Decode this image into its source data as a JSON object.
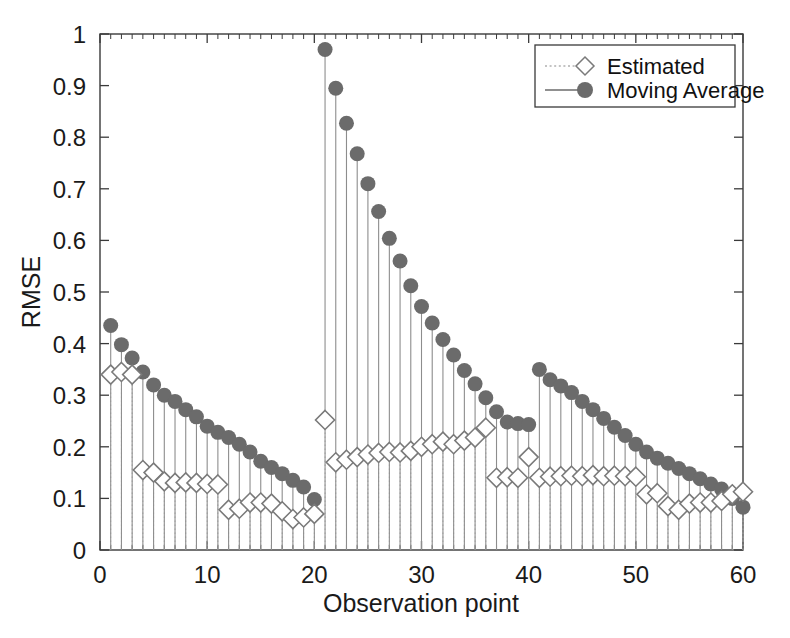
{
  "chart_data": {
    "type": "line",
    "title": "",
    "xlabel": "Observation point",
    "ylabel": "RMSE",
    "xlim": [
      0,
      60
    ],
    "ylim": [
      0,
      1
    ],
    "xticks": [
      0,
      10,
      20,
      30,
      40,
      50,
      60
    ],
    "xticklabels": [
      "0",
      "10",
      "20",
      "30",
      "40",
      "50",
      "60"
    ],
    "yticks": [
      0,
      0.1,
      0.2,
      0.3,
      0.4,
      0.5,
      0.6,
      0.7,
      0.8,
      0.9,
      1
    ],
    "yticklabels": [
      "0",
      "0.1",
      "0.2",
      "0.3",
      "0.4",
      "0.5",
      "0.6",
      "0.7",
      "0.8",
      "0.9",
      "1"
    ],
    "grid": false,
    "minor_xticks": true,
    "legend_position": "top-right",
    "x": [
      1,
      2,
      3,
      4,
      5,
      6,
      7,
      8,
      9,
      10,
      11,
      12,
      13,
      14,
      15,
      16,
      17,
      18,
      19,
      20,
      21,
      22,
      23,
      24,
      25,
      26,
      27,
      28,
      29,
      30,
      31,
      32,
      33,
      34,
      35,
      36,
      37,
      38,
      39,
      40,
      41,
      42,
      43,
      44,
      45,
      46,
      47,
      48,
      49,
      50,
      51,
      52,
      53,
      54,
      55,
      56,
      57,
      58,
      59,
      60
    ],
    "series": [
      {
        "name": "Estimated",
        "marker": "open-diamond",
        "linestyle": "dotted",
        "color": "#7a7a7a",
        "values": [
          0.34,
          0.345,
          0.34,
          0.155,
          0.15,
          0.133,
          0.13,
          0.131,
          0.13,
          0.128,
          0.127,
          0.078,
          0.08,
          0.092,
          0.092,
          0.09,
          0.075,
          0.06,
          0.063,
          0.07,
          0.252,
          0.17,
          0.175,
          0.18,
          0.185,
          0.188,
          0.19,
          0.189,
          0.192,
          0.2,
          0.205,
          0.21,
          0.205,
          0.212,
          0.218,
          0.237,
          0.14,
          0.141,
          0.14,
          0.18,
          0.14,
          0.142,
          0.143,
          0.144,
          0.143,
          0.145,
          0.143,
          0.144,
          0.143,
          0.142,
          0.108,
          0.11,
          0.085,
          0.078,
          0.09,
          0.092,
          0.092,
          0.095,
          0.108,
          0.113
        ]
      },
      {
        "name": "Moving Average",
        "marker": "filled-circle",
        "linestyle": "solid",
        "color": "#6b6b6b",
        "values": [
          0.435,
          0.398,
          0.372,
          0.345,
          0.32,
          0.3,
          0.288,
          0.272,
          0.258,
          0.24,
          0.228,
          0.218,
          0.205,
          0.19,
          0.172,
          0.16,
          0.148,
          0.135,
          0.122,
          0.098,
          0.97,
          0.895,
          0.827,
          0.768,
          0.71,
          0.656,
          0.604,
          0.56,
          0.512,
          0.472,
          0.44,
          0.408,
          0.378,
          0.348,
          0.322,
          0.295,
          0.268,
          0.248,
          0.245,
          0.243,
          0.35,
          0.33,
          0.318,
          0.305,
          0.288,
          0.272,
          0.255,
          0.238,
          0.222,
          0.205,
          0.19,
          0.178,
          0.168,
          0.158,
          0.148,
          0.138,
          0.128,
          0.118,
          0.1,
          0.083
        ]
      }
    ]
  },
  "legend": {
    "entries": [
      {
        "label": "Estimated"
      },
      {
        "label": "Moving Average"
      }
    ]
  },
  "colors": {
    "marker_gray": "#6b6b6b",
    "diamond_gray": "#7a7a7a",
    "axis_black": "#3a3a3a",
    "background": "#ffffff"
  }
}
